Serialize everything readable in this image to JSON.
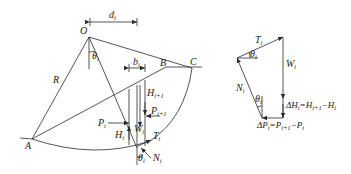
{
  "figure": {
    "type": "slope stability slice method diagram",
    "left_panel": {
      "points": {
        "O": "O",
        "A": "A",
        "B": "B",
        "C": "C"
      },
      "radius_label": "R",
      "dimensions": {
        "d": "d",
        "d_sub": "i",
        "b": "b",
        "b_sub": "i"
      },
      "angle": {
        "theta": "θ",
        "theta_sub": "i"
      },
      "forces": {
        "P_i": {
          "main": "P",
          "sub": "i"
        },
        "P_i1": {
          "main": "P",
          "sub": "i+1"
        },
        "H_i": {
          "main": "H",
          "sub": "i"
        },
        "H_i1": {
          "main": "H",
          "sub": "i+1"
        },
        "W_i": {
          "main": "W",
          "sub": "i"
        },
        "T_i": {
          "main": "T",
          "sub": "i"
        },
        "N_i": {
          "main": "N",
          "sub": "i"
        },
        "theta_bottom": {
          "main": "θ",
          "sub": "i"
        }
      }
    },
    "right_panel": {
      "title": "force polygon",
      "T": {
        "main": "T",
        "sub": "i"
      },
      "W": {
        "main": "W",
        "sub": "i"
      },
      "N": {
        "main": "N",
        "sub": "i"
      },
      "theta_top": {
        "main": "θ",
        "sub": "i"
      },
      "theta_bottom": {
        "main": "θ",
        "sub": "i"
      },
      "dH_label": "ΔH",
      "dH_sub": "i",
      "dH_eq": "=H",
      "dH_sub2": "i+1",
      "dH_tail": "−H",
      "dH_sub3": "i",
      "dP_label": "ΔP",
      "dP_sub": "i",
      "dP_eq": "=P",
      "dP_sub2": "i+1",
      "dP_tail": "−P",
      "dP_sub3": "i"
    },
    "colors": {
      "line": "#2a2a2a",
      "background": "#ffffff"
    }
  }
}
